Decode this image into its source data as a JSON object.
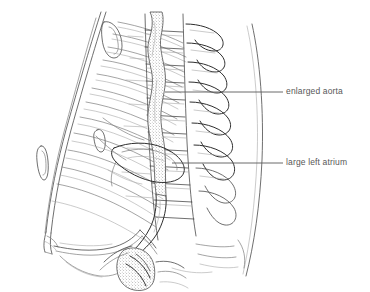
{
  "figure": {
    "background_color": "#ffffff",
    "ink_color": "#4a4a4a",
    "width": 370,
    "height": 292
  },
  "annotations": [
    {
      "id": "aorta",
      "label": "enlarged aorta",
      "leader_from_x": 165,
      "leader_from_y": 92,
      "leader_to_x": 283,
      "leader_to_y": 92,
      "label_x": 286,
      "label_y": 87
    },
    {
      "id": "atrium",
      "label": "large left atrium",
      "leader_from_x": 172,
      "leader_from_y": 163,
      "leader_to_x": 283,
      "leader_to_y": 163,
      "label_x": 286,
      "label_y": 158
    }
  ],
  "structures": {
    "aorta_label": "enlarged aorta",
    "atrium_label": "large left atrium",
    "spine_label": "thoracic and lumbar vertebrae",
    "ribs_label": "posterior rib shadows",
    "sternum_label": "sternum",
    "diaphragm_label": "diaphragm",
    "sacrum_label": "sacrum and pelvic outline"
  }
}
